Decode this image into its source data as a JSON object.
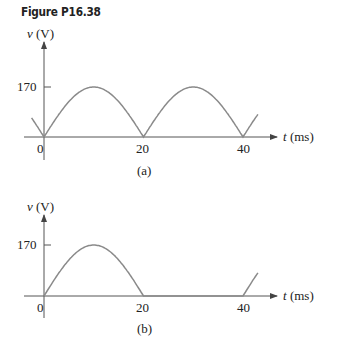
{
  "figure_title": "Figure P16.38",
  "chart_data": [
    {
      "type": "line",
      "panel": "(a)",
      "title": "Full-wave rectified sine",
      "ylabel": "v (V)",
      "xlabel": "t (ms)",
      "yticks": [
        170
      ],
      "xticks": [
        0,
        20,
        40
      ],
      "peak": 170,
      "period_ms": 20,
      "x": [
        0,
        5,
        10,
        15,
        20,
        25,
        30,
        35,
        40,
        43
      ],
      "values": [
        0,
        120.2,
        170,
        120.2,
        0,
        120.2,
        170,
        120.2,
        0,
        77.2
      ],
      "grid": false
    },
    {
      "type": "line",
      "panel": "(b)",
      "title": "Half-wave rectified sine",
      "ylabel": "v (V)",
      "xlabel": "t (ms)",
      "yticks": [
        170
      ],
      "xticks": [
        0,
        20,
        40
      ],
      "peak": 170,
      "period_ms": 40,
      "x": [
        0,
        5,
        10,
        15,
        20,
        25,
        30,
        35,
        40,
        43
      ],
      "values": [
        0,
        120.2,
        170,
        120.2,
        0,
        0,
        0,
        0,
        0,
        77.2
      ],
      "grid": false
    }
  ],
  "panels": {
    "a": {
      "ylabel": "v (V)",
      "xlabel": "t (ms)",
      "ytick": "170",
      "xticks": [
        "0",
        "20",
        "40"
      ],
      "caption": "(a)"
    },
    "b": {
      "ylabel": "v (V)",
      "xlabel": "t (ms)",
      "ytick": "170",
      "xticks": [
        "0",
        "20",
        "40"
      ],
      "caption": "(b)"
    }
  },
  "colors": {
    "axis": "#555555",
    "curve": "#8a8a8a",
    "text": "#222222"
  }
}
